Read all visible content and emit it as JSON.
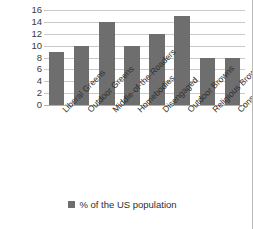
{
  "chart_data": {
    "type": "bar",
    "title": "",
    "xlabel": "",
    "ylabel": "",
    "categories": [
      "Liberal Greens",
      "Outdoor Greens",
      "Middle-of-the-Roaders",
      "Homebodies",
      "Disengaged",
      "Outdoor Browns",
      "Religious Browns",
      "Conservative Browns"
    ],
    "values": [
      9,
      10,
      14,
      10,
      12,
      15,
      8,
      8
    ],
    "series": [
      {
        "name": "% of the US population",
        "values": [
          9,
          10,
          14,
          10,
          12,
          15,
          8,
          8
        ]
      }
    ],
    "ylim": [
      0,
      16
    ],
    "ytick_labels": [
      "16",
      "14",
      "12",
      "10",
      "8",
      "6",
      "4",
      "2",
      "0"
    ],
    "ytick_values": [
      16,
      14,
      12,
      10,
      8,
      6,
      4,
      2,
      0
    ],
    "grid": true,
    "legend_position": "bottom",
    "legend_entries": [
      "% of the US population"
    ],
    "colors": {
      "bar": "#6e6e6e",
      "gridline": "#c9c9c9",
      "axis_text": "#2e2e2e",
      "background": "#ffffff",
      "frame_border": "#b9b9b9"
    }
  }
}
